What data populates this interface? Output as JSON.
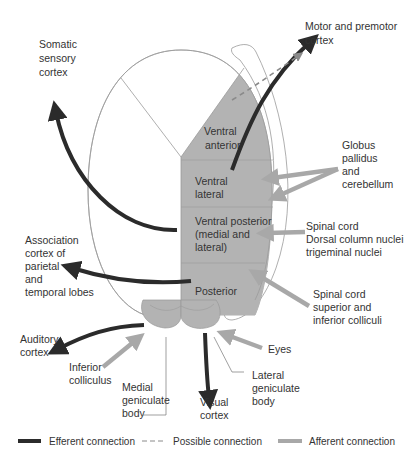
{
  "colors": {
    "efferent": "#2b2b2b",
    "afferent": "#a8a8a8",
    "possible": "#8a8a8a",
    "nucleus_fill": "#b3b3b3",
    "outline": "#9a9a9a",
    "text": "#333333"
  },
  "nuclei": {
    "ventral_anterior": [
      "Ventral",
      "anterior"
    ],
    "ventral_lateral": [
      "Ventral",
      "lateral"
    ],
    "ventral_posterior": [
      "Ventral posterior",
      "(medial and",
      "lateral)"
    ],
    "posterior": [
      "Posterior"
    ]
  },
  "labels": {
    "somatic": [
      "Somatic",
      "sensory",
      "cortex"
    ],
    "motor": [
      "Motor and premotor",
      "cortex"
    ],
    "globus": [
      "Globus",
      "pallidus",
      "and",
      "cerebellum"
    ],
    "spinal1": [
      "Spinal cord",
      "Dorsal column nuclei",
      "trigeminal nuclei"
    ],
    "association": [
      "Association",
      "cortex of",
      "parietal",
      "and",
      "temporal lobes"
    ],
    "spinal2": [
      "Spinal cord",
      "superior and",
      "inferior colliculi"
    ],
    "auditory": [
      "Auditory",
      "cortex"
    ],
    "inferior": [
      "Inferior",
      "colliculus"
    ],
    "eyes": [
      "Eyes"
    ],
    "medial_gen": [
      "Medial",
      "geniculate",
      "body"
    ],
    "visual": [
      "Visual",
      "cortex"
    ],
    "lateral_gen": [
      "Lateral",
      "geniculate",
      "body"
    ]
  },
  "legend": {
    "efferent": "Efferent connection",
    "possible": "Possible connection",
    "afferent": "Afferent connection"
  }
}
